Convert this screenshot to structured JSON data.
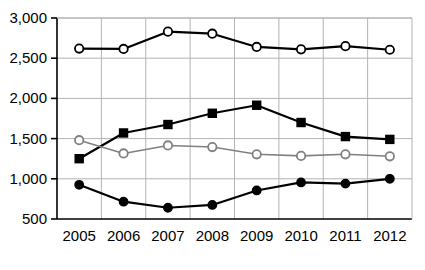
{
  "chart_data": {
    "type": "line",
    "title": "",
    "subtitle": "",
    "xlabel": "",
    "ylabel": "",
    "categories": [
      "2005",
      "2006",
      "2007",
      "2008",
      "2009",
      "2010",
      "2011",
      "2012"
    ],
    "x": [
      2005,
      2006,
      2007,
      2008,
      2009,
      2010,
      2011,
      2012
    ],
    "ylim": [
      500,
      3000
    ],
    "yticks": [
      500,
      1000,
      1500,
      2000,
      2500,
      3000
    ],
    "ytick_labels": [
      "500",
      "1,000",
      "1,500",
      "2,000",
      "2,500",
      "3,000"
    ],
    "xtick_labels": [
      "2005",
      "2006",
      "2007",
      "2008",
      "2009",
      "2010",
      "2011",
      "2012"
    ],
    "grid": {
      "horizontal": true,
      "vertical": true
    },
    "legend": {
      "visible": false,
      "position": "none"
    },
    "series": [
      {
        "name": "series-1-open-circle-black",
        "marker": "circle-open",
        "marker_fill": "#ffffff",
        "line_color": "#000000",
        "marker_edge_color": "#000000",
        "values": [
          2620,
          2615,
          2830,
          2805,
          2640,
          2610,
          2650,
          2605
        ]
      },
      {
        "name": "series-2-filled-square-black",
        "marker": "square-filled",
        "marker_fill": "#000000",
        "line_color": "#000000",
        "marker_edge_color": "#000000",
        "values": [
          1250,
          1570,
          1675,
          1815,
          1915,
          1700,
          1525,
          1490
        ]
      },
      {
        "name": "series-3-open-circle-gray",
        "marker": "circle-open",
        "marker_fill": "#ffffff",
        "line_color": "#808080",
        "marker_edge_color": "#808080",
        "values": [
          1480,
          1315,
          1415,
          1395,
          1305,
          1285,
          1305,
          1280
        ]
      },
      {
        "name": "series-4-filled-circle-black",
        "marker": "circle-filled",
        "marker_fill": "#000000",
        "line_color": "#000000",
        "marker_edge_color": "#000000",
        "values": [
          925,
          715,
          640,
          675,
          855,
          955,
          940,
          1000
        ]
      }
    ]
  },
  "axes": {
    "axis_color": "#000000",
    "grid_color": "#b3b3b3"
  }
}
